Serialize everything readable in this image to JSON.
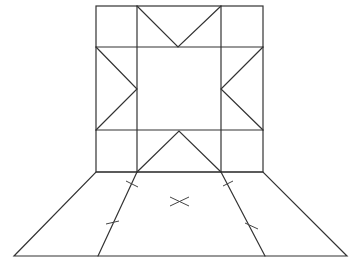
{
  "diagram": {
    "type": "quilt-block-net",
    "colors": {
      "background": "#ffffff",
      "stroke": "#333333"
    },
    "square": {
      "outer": {
        "x1": 96,
        "y1": 6,
        "x2": 263,
        "y2": 172
      },
      "grid_x": [
        96,
        137,
        221,
        263
      ],
      "grid_y": [
        6,
        47,
        130,
        172
      ]
    },
    "triangles": [
      {
        "name": "top",
        "points": [
          [
            137,
            6
          ],
          [
            178,
            47
          ],
          [
            221,
            6
          ]
        ]
      },
      {
        "name": "bottom",
        "points": [
          [
            137,
            172
          ],
          [
            179,
            131
          ],
          [
            221,
            172
          ]
        ]
      },
      {
        "name": "left",
        "points": [
          [
            96,
            47
          ],
          [
            137,
            89
          ],
          [
            96,
            130
          ]
        ]
      },
      {
        "name": "right",
        "points": [
          [
            263,
            47
          ],
          [
            221,
            89
          ],
          [
            263,
            130
          ]
        ]
      }
    ],
    "trapezoid": {
      "outer": [
        [
          96,
          172
        ],
        [
          263,
          172
        ],
        [
          347,
          256
        ],
        [
          14,
          256
        ]
      ],
      "inner_left": [
        [
          137,
          172
        ],
        [
          98,
          256
        ]
      ],
      "inner_right": [
        [
          221,
          172
        ],
        [
          265,
          256
        ]
      ]
    },
    "tick_marks": [
      [
        [
          126,
          181
        ],
        [
          138,
          187
        ]
      ],
      [
        [
          106,
          224
        ],
        [
          119,
          221
        ]
      ],
      [
        [
          223,
          186
        ],
        [
          233,
          181
        ]
      ],
      [
        [
          245,
          223
        ],
        [
          258,
          229
        ]
      ]
    ],
    "center_mark": {
      "x": 180,
      "y": 202,
      "label": "×"
    }
  }
}
